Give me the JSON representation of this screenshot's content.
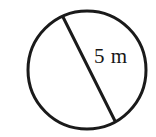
{
  "figure": {
    "kind": "circle-with-diameter-diagram",
    "background_color": "#ffffff",
    "stroke_color": "#1a1a1a",
    "label_color": "#171717",
    "circle": {
      "center_x": 87,
      "center_y": 70,
      "radius": 59,
      "stroke_width": 3
    },
    "chord": {
      "name": "diameter-line",
      "x1": 63,
      "y1": 17,
      "x2": 115,
      "y2": 121,
      "stroke_width": 3
    },
    "measurement_label": "5 m",
    "measurement_value": 5,
    "measurement_unit": "m"
  },
  "chart_data": {
    "type": "diagram",
    "title": "",
    "shape": "circle",
    "annotations": [
      {
        "text": "5 m",
        "refers_to": "diameter",
        "value": 5,
        "unit": "m",
        "x": 94,
        "y": 46
      }
    ]
  }
}
